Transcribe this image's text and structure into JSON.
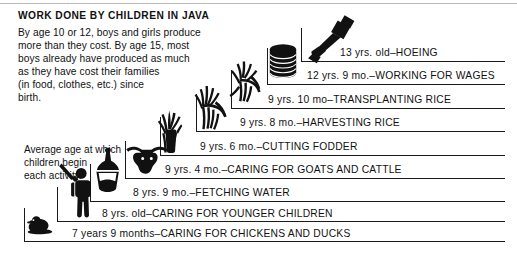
{
  "title": "WORK DONE BY CHILDREN IN JAVA",
  "intro_lines": [
    "By age 10 or 12, boys and girls produce",
    "more than they cost. By age 15, most",
    "boys already have produced as much",
    "as they have cost their families",
    "(in food, clothes, etc.) since",
    "birth."
  ],
  "caption_lines": [
    "Average age at which",
    "children begin",
    "each activity."
  ],
  "colors": {
    "ink": "#1a1a1a",
    "rule": "#b8b8b8",
    "background": "#ffffff"
  },
  "chart_data": {
    "type": "bar",
    "title": "WORK DONE BY CHILDREN IN JAVA",
    "xlabel": "",
    "ylabel": "Average age at which children begin each activity",
    "note": "Step/staircase chart: each rung is an activity placed at the average starting age of Javanese children.",
    "categories": [
      "CARING FOR CHICKENS AND DUCKS",
      "CARING FOR YOUNGER CHILDREN",
      "FETCHING WATER",
      "CARING FOR GOATS AND CATTLE",
      "CUTTING FODDER",
      "HARVESTING RICE",
      "TRANSPLANTING RICE",
      "WORKING FOR WAGES",
      "HOEING"
    ],
    "values": [
      7.75,
      8.0,
      8.75,
      9.333,
      9.5,
      9.667,
      9.833,
      12.75,
      13.0
    ],
    "value_labels": [
      "7 years 9 months",
      "8 yrs. old",
      "8 yrs. 9 mo.",
      "9 yrs. 4 mo.",
      "9 yrs. 6 mo.",
      "9 yrs. 8 mo.",
      "9 yrs. 10 mo",
      "12 yrs. 9 mo.",
      "13 yrs. old"
    ],
    "ylim": [
      7.5,
      13.5
    ],
    "grid": false,
    "legend": null
  },
  "rungs": [
    {
      "label": "13 yrs. old–HOEING",
      "age_label": "13 yrs. old",
      "activity": "HOEING",
      "icon": "hoe-icon",
      "line_y": 61,
      "riser_x": 301,
      "riser_top": 28,
      "label_x": 340,
      "label_y": 47
    },
    {
      "label": "12 yrs. 9 mo.–WORKING FOR WAGES",
      "age_label": "12 yrs. 9 mo.",
      "activity": "WORKING FOR WAGES",
      "icon": "coins-icon",
      "line_y": 84,
      "riser_x": 267,
      "riser_top": 48,
      "label_x": 307,
      "label_y": 70
    },
    {
      "label": "9 yrs. 10 mo–TRANSPLANTING RICE",
      "age_label": "9 yrs. 10 mo",
      "activity": "TRANSPLANTING RICE",
      "icon": "rice-seedling-icon",
      "line_y": 108,
      "riser_x": 231,
      "riser_top": 70,
      "label_x": 268,
      "label_y": 94
    },
    {
      "label": "9 yrs. 8 mo.–HARVESTING RICE",
      "age_label": "9 yrs. 8 mo.",
      "activity": "HARVESTING RICE",
      "icon": "rice-sheaf-icon",
      "line_y": 131,
      "riser_x": 196,
      "riser_top": 94,
      "label_x": 240,
      "label_y": 117
    },
    {
      "label": "9 yrs. 6 mo.–CUTTING FODDER",
      "age_label": "9 yrs. 6 mo.",
      "activity": "CUTTING FODDER",
      "icon": "fodder-grass-icon",
      "line_y": 155,
      "riser_x": 160,
      "riser_top": 117,
      "label_x": 200,
      "label_y": 141
    },
    {
      "label": "9 yrs. 4 mo.–CARING FOR GOATS AND CATTLE",
      "age_label": "9 yrs. 4 mo.",
      "activity": "CARING FOR GOATS AND CATTLE",
      "icon": "cattle-head-icon",
      "line_y": 178,
      "riser_x": 125,
      "riser_top": 141,
      "label_x": 165,
      "label_y": 164
    },
    {
      "label": "8 yrs. 9 mo.–FETCHING WATER",
      "age_label": "8 yrs. 9 mo.",
      "activity": "FETCHING WATER",
      "icon": "water-vessel-icon",
      "line_y": 201,
      "riser_x": 90,
      "riser_top": 164,
      "label_x": 133,
      "label_y": 187
    },
    {
      "label": "8 yrs. old–CARING FOR YOUNGER CHILDREN",
      "age_label": "8 yrs. old",
      "activity": "CARING FOR YOUNGER CHILDREN",
      "icon": "child-figure-icon",
      "line_y": 221,
      "riser_x": 57,
      "riser_top": 187,
      "label_x": 102,
      "label_y": 208
    },
    {
      "label": "7 years 9 months–CARING FOR CHICKENS AND DUCKS",
      "age_label": "7 years 9 months",
      "activity": "CARING FOR CHICKENS AND DUCKS",
      "icon": "duck-icon",
      "line_y": 241,
      "riser_x": 24,
      "riser_top": 208,
      "label_x": 72,
      "label_y": 228
    }
  ]
}
